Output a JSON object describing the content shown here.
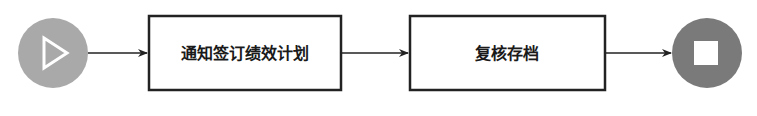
{
  "diagram": {
    "type": "flowchart",
    "start": {
      "icon": "play-icon",
      "color": "#a9a9a9"
    },
    "steps": [
      {
        "label": "通知签订绩效计划"
      },
      {
        "label": "复核存档"
      }
    ],
    "end": {
      "icon": "stop-icon",
      "color": "#7a7a7a"
    },
    "edges": [
      {
        "from": "start",
        "to": "step-1"
      },
      {
        "from": "step-1",
        "to": "step-2"
      },
      {
        "from": "step-2",
        "to": "end"
      }
    ]
  }
}
